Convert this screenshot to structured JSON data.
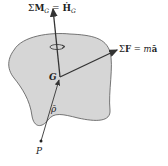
{
  "diagram": {
    "body_fill": "#d6d6d6",
    "body_stroke": "#555555",
    "vector_color": "#333333",
    "labels": {
      "moment_sum": "Σ",
      "moment_symbol": "M",
      "moment_sub": "G",
      "equals": "=",
      "hdot_symbol": "Ḣ",
      "hdot_sub": "G",
      "force_sum": "Σ",
      "force_symbol": "F",
      "force_rhs_m": "m",
      "force_rhs_a": "ā",
      "center_of_mass": "G",
      "position_vector": "ρ̄",
      "point": "P"
    }
  }
}
